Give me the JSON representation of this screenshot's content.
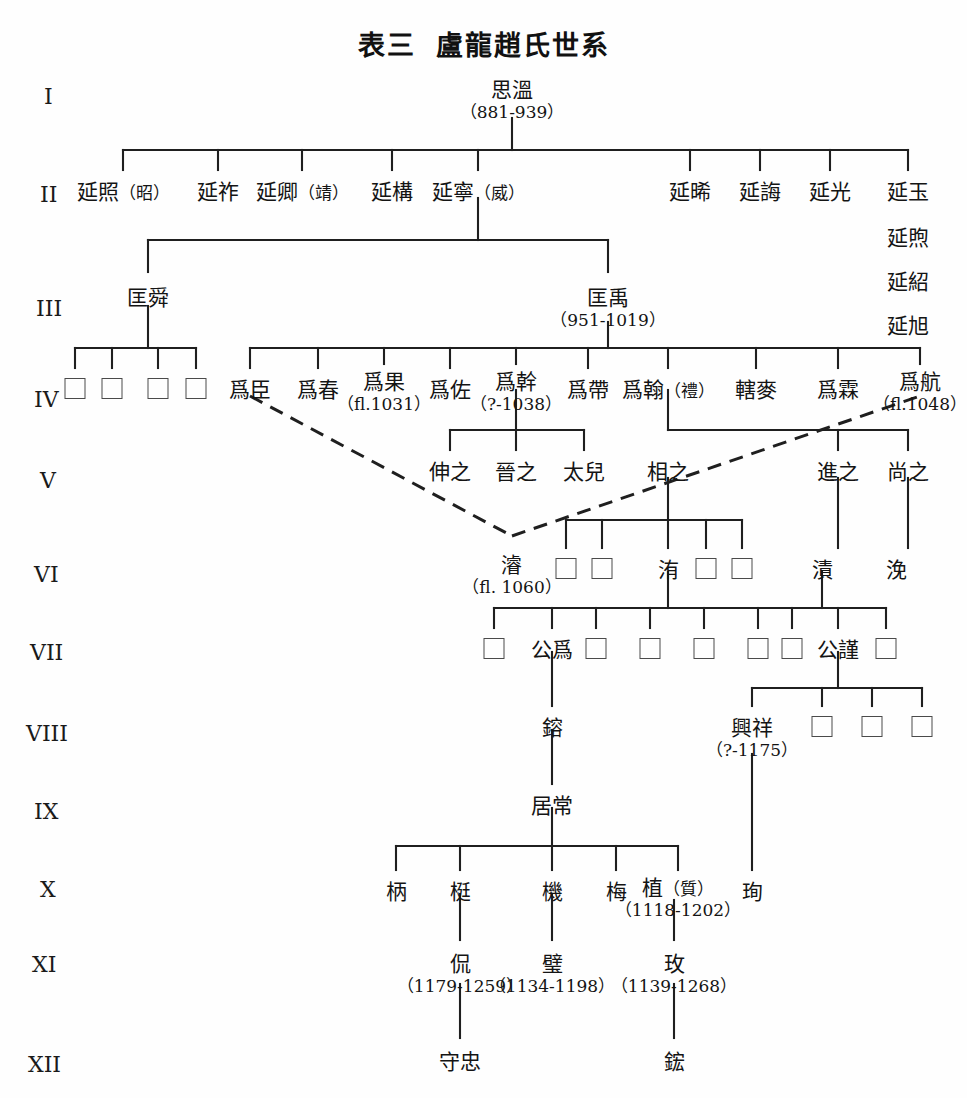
{
  "title": {
    "prefix": "表三",
    "main": "盧龍趙氏世系"
  },
  "generation_labels": [
    {
      "id": "gen-1",
      "label": "I",
      "x": 44,
      "y": 84
    },
    {
      "id": "gen-2",
      "label": "II",
      "x": 40,
      "y": 182
    },
    {
      "id": "gen-3",
      "label": "III",
      "x": 36,
      "y": 296
    },
    {
      "id": "gen-4",
      "label": "IV",
      "x": 34,
      "y": 387
    },
    {
      "id": "gen-5",
      "label": "V",
      "x": 40,
      "y": 468
    },
    {
      "id": "gen-6",
      "label": "VI",
      "x": 34,
      "y": 562
    },
    {
      "id": "gen-7",
      "label": "VII",
      "x": 30,
      "y": 640
    },
    {
      "id": "gen-8",
      "label": "VIII",
      "x": 26,
      "y": 721
    },
    {
      "id": "gen-9",
      "label": "IX",
      "x": 34,
      "y": 799
    },
    {
      "id": "gen-10",
      "label": "X",
      "x": 40,
      "y": 877
    },
    {
      "id": "gen-11",
      "label": "XI",
      "x": 32,
      "y": 952
    },
    {
      "id": "gen-12",
      "label": "XII",
      "x": 28,
      "y": 1052
    }
  ],
  "nodes": [
    {
      "id": "n-siwen",
      "name": "思溫",
      "dates": "（881-939）",
      "x": 512,
      "y": 80,
      "gen": 1
    },
    {
      "id": "n-yanzhao",
      "name": "延照",
      "alt": "（昭）",
      "dates": "",
      "x": 123,
      "y": 182,
      "gen": 2
    },
    {
      "id": "n-yanzuo",
      "name": "延祚",
      "alt": "",
      "dates": "",
      "x": 218,
      "y": 182,
      "gen": 2
    },
    {
      "id": "n-yanqing",
      "name": "延卿",
      "alt": "（靖）",
      "dates": "",
      "x": 302,
      "y": 182,
      "gen": 2
    },
    {
      "id": "n-yangou",
      "name": "延構",
      "alt": "",
      "dates": "",
      "x": 392,
      "y": 182,
      "gen": 2
    },
    {
      "id": "n-yanning",
      "name": "延寧",
      "alt": "（威）",
      "dates": "",
      "x": 478,
      "y": 182,
      "gen": 2
    },
    {
      "id": "n-yanxi",
      "name": "延晞",
      "alt": "",
      "dates": "",
      "x": 690,
      "y": 182,
      "gen": 2
    },
    {
      "id": "n-yanhui",
      "name": "延誨",
      "alt": "",
      "dates": "",
      "x": 760,
      "y": 182,
      "gen": 2
    },
    {
      "id": "n-yanguang",
      "name": "延光",
      "alt": "",
      "dates": "",
      "x": 830,
      "y": 182,
      "gen": 2
    },
    {
      "id": "n-yanyu",
      "name": "延玉",
      "alt": "",
      "dates": "",
      "x": 908,
      "y": 182,
      "gen": 2
    },
    {
      "id": "n-yanxu",
      "name": "延煦",
      "alt": "",
      "dates": "",
      "x": 908,
      "y": 228,
      "gen": 2
    },
    {
      "id": "n-yanshao",
      "name": "延紹",
      "alt": "",
      "dates": "",
      "x": 908,
      "y": 272,
      "gen": 2
    },
    {
      "id": "n-yanxu2",
      "name": "延旭",
      "alt": "",
      "dates": "",
      "x": 908,
      "y": 316,
      "gen": 2
    },
    {
      "id": "n-kuangshun",
      "name": "匡舜",
      "alt": "",
      "dates": "",
      "x": 148,
      "y": 288,
      "gen": 3
    },
    {
      "id": "n-kuangyu",
      "name": "匡禹",
      "alt": "",
      "dates": "（951-1019）",
      "x": 608,
      "y": 288,
      "gen": 3
    },
    {
      "id": "n-weichen",
      "name": "爲臣",
      "alt": "",
      "dates": "",
      "x": 250,
      "y": 380,
      "gen": 4
    },
    {
      "id": "n-weichun",
      "name": "爲春",
      "alt": "",
      "dates": "",
      "x": 318,
      "y": 380,
      "gen": 4
    },
    {
      "id": "n-weiguo",
      "name": "爲果",
      "alt": "",
      "dates": "（fl.1031）",
      "x": 384,
      "y": 372,
      "gen": 4
    },
    {
      "id": "n-weizuo",
      "name": "爲佐",
      "alt": "",
      "dates": "",
      "x": 450,
      "y": 380,
      "gen": 4
    },
    {
      "id": "n-weigan",
      "name": "爲幹",
      "alt": "",
      "dates": "（?-1038）",
      "x": 516,
      "y": 372,
      "gen": 4
    },
    {
      "id": "n-weidai",
      "name": "爲帶",
      "alt": "",
      "dates": "",
      "x": 588,
      "y": 380,
      "gen": 4
    },
    {
      "id": "n-weihan",
      "name": "爲翰",
      "alt": "（禮）",
      "dates": "",
      "x": 668,
      "y": 380,
      "gen": 4
    },
    {
      "id": "n-xiamai",
      "name": "轄麥",
      "alt": "",
      "dates": "",
      "x": 756,
      "y": 380,
      "gen": 4
    },
    {
      "id": "n-weilin",
      "name": "爲霖",
      "alt": "",
      "dates": "",
      "x": 838,
      "y": 380,
      "gen": 4
    },
    {
      "id": "n-weihang",
      "name": "爲航",
      "alt": "",
      "dates": "（fl.1048）",
      "x": 920,
      "y": 372,
      "gen": 4
    },
    {
      "id": "n-shenzhi",
      "name": "伸之",
      "alt": "",
      "dates": "",
      "x": 450,
      "y": 462,
      "gen": 5
    },
    {
      "id": "n-jinzhi",
      "name": "晉之",
      "alt": "",
      "dates": "",
      "x": 516,
      "y": 462,
      "gen": 5
    },
    {
      "id": "n-taier",
      "name": "太兒",
      "alt": "",
      "dates": "",
      "x": 584,
      "y": 462,
      "gen": 5
    },
    {
      "id": "n-xiangzhi",
      "name": "相之",
      "alt": "",
      "dates": "",
      "x": 668,
      "y": 462,
      "gen": 5
    },
    {
      "id": "n-jinzhi2",
      "name": "進之",
      "alt": "",
      "dates": "",
      "x": 838,
      "y": 462,
      "gen": 5
    },
    {
      "id": "n-shangzhi",
      "name": "尚之",
      "alt": "",
      "dates": "",
      "x": 908,
      "y": 462,
      "gen": 5
    },
    {
      "id": "n-jun",
      "name": "濬",
      "alt": "",
      "dates": "（fl. 1060）",
      "x": 512,
      "y": 555,
      "gen": 6
    },
    {
      "id": "n-wei",
      "name": "洧",
      "alt": "",
      "dates": "",
      "x": 668,
      "y": 560,
      "gen": 6
    },
    {
      "id": "n-zi",
      "name": "漬",
      "alt": "",
      "dates": "",
      "x": 822,
      "y": 560,
      "gen": 6
    },
    {
      "id": "n-mian",
      "name": "浼",
      "alt": "",
      "dates": "",
      "x": 896,
      "y": 560,
      "gen": 6
    },
    {
      "id": "n-gongwei",
      "name": "公爲",
      "alt": "",
      "dates": "",
      "x": 552,
      "y": 640,
      "gen": 7
    },
    {
      "id": "n-gongjin",
      "name": "公謹",
      "alt": "",
      "dates": "",
      "x": 838,
      "y": 640,
      "gen": 7
    },
    {
      "id": "n-rong",
      "name": "鎔",
      "alt": "",
      "dates": "",
      "x": 552,
      "y": 718,
      "gen": 8
    },
    {
      "id": "n-xingxiang",
      "name": "興祥",
      "alt": "",
      "dates": "（?-1175）",
      "x": 752,
      "y": 718,
      "gen": 8
    },
    {
      "id": "n-juchang",
      "name": "居常",
      "alt": "",
      "dates": "",
      "x": 552,
      "y": 796,
      "gen": 9
    },
    {
      "id": "n-bing",
      "name": "柄",
      "alt": "",
      "dates": "",
      "x": 396,
      "y": 882,
      "gen": 10
    },
    {
      "id": "n-ting",
      "name": "梃",
      "alt": "",
      "dates": "",
      "x": 460,
      "y": 882,
      "gen": 10
    },
    {
      "id": "n-ji",
      "name": "機",
      "alt": "",
      "dates": "",
      "x": 552,
      "y": 882,
      "gen": 10
    },
    {
      "id": "n-mei",
      "name": "梅",
      "alt": "",
      "dates": "",
      "x": 616,
      "y": 882,
      "gen": 10
    },
    {
      "id": "n-zhi",
      "name": "植",
      "alt": "（質）",
      "dates": "（1118-1202）",
      "x": 678,
      "y": 878,
      "gen": 10
    },
    {
      "id": "n-xun",
      "name": "珣",
      "alt": "",
      "dates": "",
      "x": 752,
      "y": 882,
      "gen": 10
    },
    {
      "id": "n-kan",
      "name": "侃",
      "alt": "",
      "dates": "（1179-1259）",
      "x": 460,
      "y": 954,
      "gen": 11
    },
    {
      "id": "n-bi",
      "name": "璧",
      "alt": "",
      "dates": "（1134-1198）",
      "x": 552,
      "y": 954,
      "gen": 11
    },
    {
      "id": "n-mei2",
      "name": "玫",
      "alt": "",
      "dates": "（1139-1268）",
      "x": 674,
      "y": 954,
      "gen": 11
    },
    {
      "id": "n-shouzhong",
      "name": "守忠",
      "alt": "",
      "dates": "",
      "x": 460,
      "y": 1052,
      "gen": 12
    },
    {
      "id": "n-hong",
      "name": "鋐",
      "alt": "",
      "dates": "",
      "x": 674,
      "y": 1052,
      "gen": 12
    }
  ],
  "unnamed_nodes": [
    {
      "id": "b-4-1",
      "x": 75,
      "y": 378,
      "gen": 4
    },
    {
      "id": "b-4-2",
      "x": 112,
      "y": 378,
      "gen": 4
    },
    {
      "id": "b-4-3",
      "x": 158,
      "y": 378,
      "gen": 4
    },
    {
      "id": "b-4-4",
      "x": 196,
      "y": 378,
      "gen": 4
    },
    {
      "id": "b-6-1",
      "x": 566,
      "y": 558,
      "gen": 6
    },
    {
      "id": "b-6-2",
      "x": 602,
      "y": 558,
      "gen": 6
    },
    {
      "id": "b-6-3",
      "x": 706,
      "y": 558,
      "gen": 6
    },
    {
      "id": "b-6-4",
      "x": 742,
      "y": 558,
      "gen": 6
    },
    {
      "id": "b-7-1",
      "x": 494,
      "y": 638,
      "gen": 7
    },
    {
      "id": "b-7-2",
      "x": 596,
      "y": 638,
      "gen": 7
    },
    {
      "id": "b-7-3",
      "x": 650,
      "y": 638,
      "gen": 7
    },
    {
      "id": "b-7-4",
      "x": 704,
      "y": 638,
      "gen": 7
    },
    {
      "id": "b-7-5",
      "x": 758,
      "y": 638,
      "gen": 7
    },
    {
      "id": "b-7-6",
      "x": 792,
      "y": 638,
      "gen": 7
    },
    {
      "id": "b-7-7",
      "x": 886,
      "y": 638,
      "gen": 7
    },
    {
      "id": "b-8-1",
      "x": 822,
      "y": 716,
      "gen": 8
    },
    {
      "id": "b-8-2",
      "x": 872,
      "y": 716,
      "gen": 8
    },
    {
      "id": "b-8-3",
      "x": 922,
      "y": 716,
      "gen": 8
    }
  ],
  "connectors": {
    "stroke": "#1f1f1f",
    "stroke_width": 2.1,
    "solid_paths": [
      "M512,118 L512,150",
      "M123,150 L908,150",
      "M123,150 L123,170",
      "M218,150 L218,170",
      "M302,150 L302,170",
      "M392,150 L392,170",
      "M478,150 L478,170",
      "M690,150 L690,170",
      "M760,150 L760,170",
      "M830,150 L830,170",
      "M908,150 L908,170",
      "M478,198 L478,240",
      "M148,240 L608,240",
      "M148,240 L148,272",
      "M608,240 L608,272",
      "M148,306 L148,348",
      "M75,348 L196,348",
      "M75,348 L75,368",
      "M112,348 L112,368",
      "M158,348 L158,368",
      "M196,348 L196,368",
      "M608,322 L608,348",
      "M250,348 L920,348",
      "M250,348 L250,368",
      "M318,348 L318,368",
      "M384,348 L384,364",
      "M450,348 L450,368",
      "M516,348 L516,364",
      "M588,348 L588,368",
      "M668,348 L668,368",
      "M756,348 L756,368",
      "M838,348 L838,368",
      "M920,348 L920,364",
      "M516,390 L516,430",
      "M450,430 L584,430",
      "M450,430 L450,450",
      "M516,430 L516,450",
      "M584,430 L584,450",
      "M668,390 L668,430",
      "M668,430 L908,430",
      "M838,430 L838,450",
      "M908,430 L908,450",
      "M668,478 L668,520",
      "M566,520 L742,520",
      "M566,520 L566,548",
      "M602,520 L602,548",
      "M668,520 L668,548",
      "M706,520 L706,548",
      "M742,520 L742,548",
      "M838,478 L838,548",
      "M908,478 L908,548",
      "M668,572 L668,608",
      "M494,608 L792,608",
      "M494,608 L494,628",
      "M552,608 L552,628",
      "M596,608 L596,628",
      "M650,608 L650,628",
      "M704,608 L704,628",
      "M758,608 L758,628",
      "M822,572 L822,608",
      "M792,608 L886,608",
      "M792,608 L792,628",
      "M838,608 L838,628",
      "M886,608 L886,628",
      "M552,652 L552,706",
      "M838,652 L838,688",
      "M752,688 L922,688",
      "M752,688 L752,706",
      "M822,688 L822,706",
      "M872,688 L872,706",
      "M922,688 L922,706",
      "M552,730 L552,784",
      "M552,808 L552,846",
      "M396,846 L678,846",
      "M396,846 L396,870",
      "M460,846 L460,870",
      "M552,846 L552,870",
      "M616,846 L616,870",
      "M678,846 L678,870",
      "M752,754 L752,870",
      "M460,894 L460,940",
      "M552,894 L552,940",
      "M674,900 L674,940",
      "M460,984 L460,1038",
      "M674,984 L674,1038"
    ],
    "dashed_paths": [
      "M250,396 L512,536",
      "M512,536 L920,396"
    ],
    "dash_pattern": "14,9",
    "dash_width": 3.0
  }
}
